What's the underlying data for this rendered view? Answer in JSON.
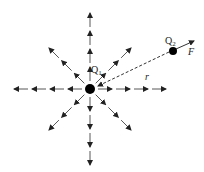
{
  "diagram": {
    "labels": {
      "q1": "Q",
      "q1_sub": "1",
      "q2": "Q",
      "q2_sub": "2",
      "force": "F",
      "distance": "r"
    },
    "field_line_directions_deg": [
      0,
      45,
      90,
      135,
      180,
      225,
      270,
      315
    ],
    "colors": {
      "line": "#333333",
      "charge": "#000000"
    }
  }
}
